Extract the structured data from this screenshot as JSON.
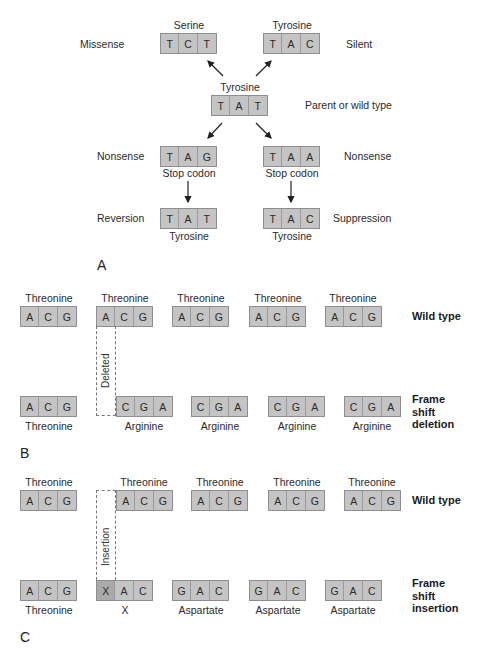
{
  "panel_a": {
    "label": "A",
    "wild": {
      "amino": "Tyrosine",
      "codon": [
        "T",
        "A",
        "T"
      ],
      "side_label": "Parent or wild type"
    },
    "missense": {
      "side_label": "Missense",
      "amino": "Serine",
      "codon": [
        "T",
        "C",
        "T"
      ]
    },
    "silent": {
      "side_label": "Silent",
      "amino": "Tyrosine",
      "codon": [
        "T",
        "A",
        "C"
      ]
    },
    "nonsense_left": {
      "side_label": "Nonsense",
      "codon": [
        "T",
        "A",
        "G"
      ],
      "note": "Stop codon"
    },
    "nonsense_right": {
      "side_label": "Nonsense",
      "codon": [
        "T",
        "A",
        "A"
      ],
      "note": "Stop codon"
    },
    "reversion": {
      "side_label": "Reversion",
      "codon": [
        "T",
        "A",
        "T"
      ],
      "amino": "Tyrosine"
    },
    "suppression": {
      "side_label": "Suppression",
      "codon": [
        "T",
        "A",
        "C"
      ],
      "amino": "Tyrosine"
    }
  },
  "panel_b": {
    "label": "B",
    "wild_row": {
      "side_label": "Wild type",
      "codons": [
        {
          "amino": "Threonine",
          "bases": [
            "A",
            "C",
            "G"
          ]
        },
        {
          "amino": "Threonine",
          "bases": [
            "A",
            "C",
            "G"
          ]
        },
        {
          "amino": "Threonine",
          "bases": [
            "A",
            "C",
            "G"
          ]
        },
        {
          "amino": "Threonine",
          "bases": [
            "A",
            "C",
            "G"
          ]
        },
        {
          "amino": "Threonine",
          "bases": [
            "A",
            "C",
            "G"
          ]
        }
      ]
    },
    "deleted_label": "Deleted",
    "mutant_row": {
      "side_label": [
        "Frame",
        "shift",
        "deletion"
      ],
      "codons": [
        {
          "amino": "Threonine",
          "bases": [
            "A",
            "C",
            "G"
          ]
        },
        {
          "amino": "Arginine",
          "bases": [
            "C",
            "G",
            "A"
          ]
        },
        {
          "amino": "Arginine",
          "bases": [
            "C",
            "G",
            "A"
          ]
        },
        {
          "amino": "Arginine",
          "bases": [
            "C",
            "G",
            "A"
          ]
        },
        {
          "amino": "Arginine",
          "bases": [
            "C",
            "G",
            "A"
          ]
        }
      ]
    }
  },
  "panel_c": {
    "label": "C",
    "wild_row": {
      "side_label": "Wild type",
      "codons": [
        {
          "amino": "Threonine",
          "bases": [
            "A",
            "C",
            "G"
          ]
        },
        {
          "amino": "Threonine",
          "bases": [
            "A",
            "C",
            "G"
          ]
        },
        {
          "amino": "Threonine",
          "bases": [
            "A",
            "C",
            "G"
          ]
        },
        {
          "amino": "Threonine",
          "bases": [
            "A",
            "C",
            "G"
          ]
        },
        {
          "amino": "Threonine",
          "bases": [
            "A",
            "C",
            "G"
          ]
        }
      ]
    },
    "insertion_label": "Insertion",
    "mutant_row": {
      "side_label": [
        "Frame",
        "shift",
        "insertion"
      ],
      "codons": [
        {
          "amino": "Threonine",
          "bases": [
            "A",
            "C",
            "G"
          ]
        },
        {
          "amino": "X",
          "bases": [
            "X",
            "A",
            "C"
          ]
        },
        {
          "amino": "Aspartate",
          "bases": [
            "G",
            "A",
            "C"
          ]
        },
        {
          "amino": "Aspartate",
          "bases": [
            "G",
            "A",
            "C"
          ]
        },
        {
          "amino": "Aspartate",
          "bases": [
            "G",
            "A",
            "C"
          ]
        }
      ]
    }
  },
  "colors": {
    "box_fill": "#c4c4c4",
    "box_border": "#8e8e8e",
    "inserted_base_fill": "#a9a9a9"
  }
}
